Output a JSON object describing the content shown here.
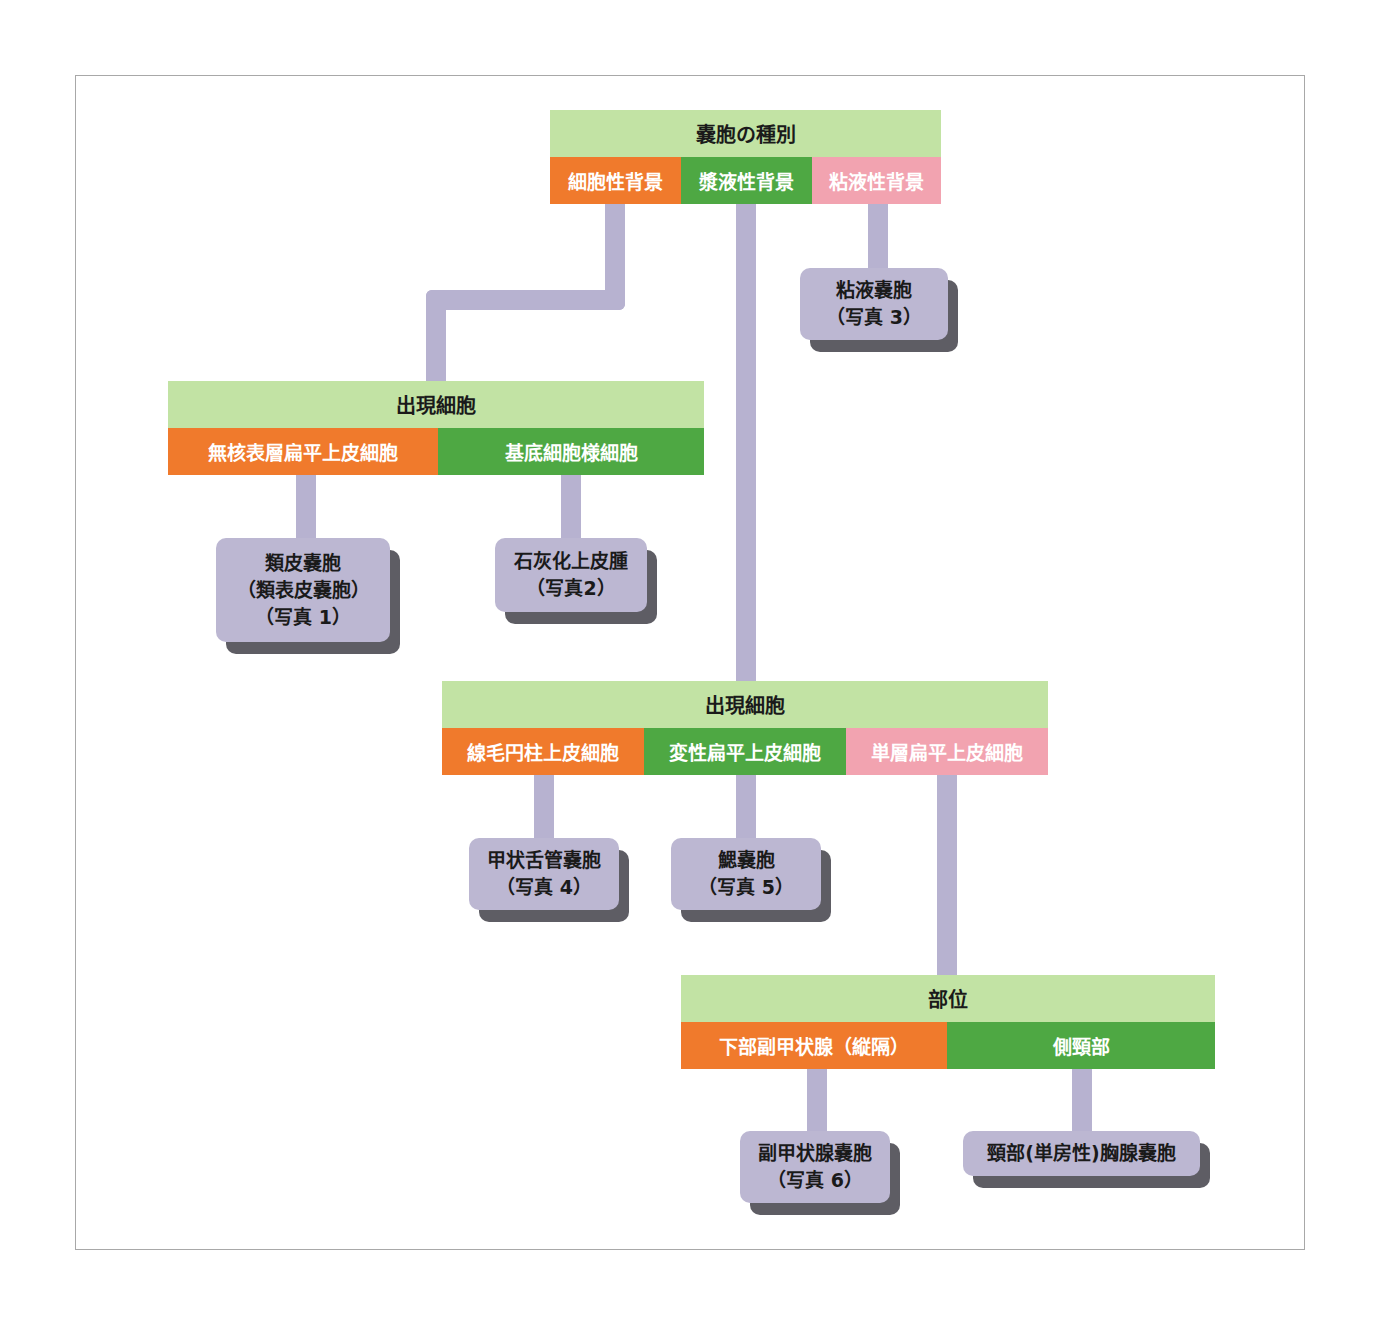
{
  "colors": {
    "header_title_bg": "#c2e3a4",
    "orange": "#f07a2c",
    "green": "#4ea843",
    "pink": "#f2a3b0",
    "connector": "#b7b2d0",
    "leaf_face": "#bcb7d2",
    "leaf_shadow": "#5e5d64"
  },
  "root": {
    "title": "嚢胞の種別",
    "categories": [
      "細胞性背景",
      "漿液性背景",
      "粘液性背景"
    ]
  },
  "mucous_leaf": {
    "lines": [
      "粘液嚢胞",
      "（写真 3）"
    ]
  },
  "cellular_group": {
    "title": "出現細胞",
    "categories": [
      "無核表層扁平上皮細胞",
      "基底細胞様細胞"
    ],
    "leaves": [
      {
        "lines": [
          "類皮嚢胞",
          "（類表皮嚢胞）",
          "（写真 1）"
        ]
      },
      {
        "lines": [
          "石灰化上皮腫",
          "（写真2）"
        ]
      }
    ]
  },
  "serous_group": {
    "title": "出現細胞",
    "categories": [
      "線毛円柱上皮細胞",
      "変性扁平上皮細胞",
      "単層扁平上皮細胞"
    ],
    "leaves": [
      {
        "lines": [
          "甲状舌管嚢胞",
          "（写真 4）"
        ]
      },
      {
        "lines": [
          "鰓嚢胞",
          "（写真 5）"
        ]
      }
    ]
  },
  "site_group": {
    "title": "部位",
    "categories": [
      "下部副甲状腺（縦隔）",
      "側頸部"
    ],
    "leaves": [
      {
        "lines": [
          "副甲状腺嚢胞",
          "（写真 6）"
        ]
      },
      {
        "lines": [
          "頸部(単房性)胸腺嚢胞"
        ]
      }
    ]
  }
}
